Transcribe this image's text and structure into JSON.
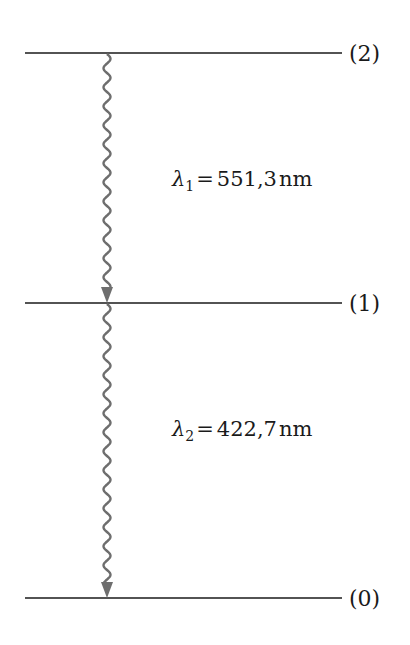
{
  "diagram": {
    "type": "energy-level-diagram",
    "levels": [
      {
        "id": "level-2",
        "label": "(2)"
      },
      {
        "id": "level-1",
        "label": "(1)"
      },
      {
        "id": "level-0",
        "label": "(0)"
      }
    ],
    "transitions": [
      {
        "from": "level-2",
        "to": "level-1",
        "symbol": "λ",
        "subscript": "1",
        "equals": "=",
        "value": "551,3",
        "unit": "nm"
      },
      {
        "from": "level-1",
        "to": "level-0",
        "symbol": "λ",
        "subscript": "2",
        "equals": "=",
        "value": "422,7",
        "unit": "nm"
      }
    ],
    "colors": {
      "level_line": "#1a1a1a",
      "photon": "#6e6e6e",
      "text": "#1a1a1a"
    }
  }
}
